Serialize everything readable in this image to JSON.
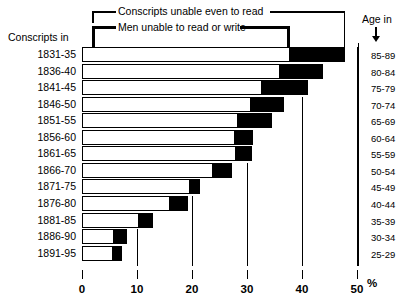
{
  "chart_data": {
    "type": "bar",
    "orientation": "horizontal",
    "stacked": true,
    "title": "",
    "xlabel": "%",
    "ylabel": "Conscripts in",
    "right_axis_label": "Age in",
    "xlim": [
      0,
      50
    ],
    "xticks": [
      0,
      10,
      20,
      30,
      40,
      50
    ],
    "xtick_labels": [
      "0",
      "10",
      "20",
      "30",
      "40",
      "50"
    ],
    "grid": true,
    "legend_position": "top",
    "categories": [
      "1831-35",
      "1836-40",
      "1841-45",
      "1846-50",
      "1851-55",
      "1856-60",
      "1861-65",
      "1866-70",
      "1871-75",
      "1876-80",
      "1881-85",
      "1886-90",
      "1891-95"
    ],
    "right_categories": [
      "85-89",
      "80-84",
      "75-79",
      "70-74",
      "65-69",
      "60-64",
      "55-59",
      "50-54",
      "45-49",
      "40-44",
      "35-39",
      "30-34",
      "25-29"
    ],
    "series": [
      {
        "name": "Men unable to read or write",
        "color": "#ffffff",
        "values": [
          37.8,
          36.0,
          32.7,
          30.7,
          28.4,
          27.8,
          28.0,
          23.8,
          19.6,
          16.0,
          10.4,
          5.8,
          5.6
        ]
      },
      {
        "name": "Conscripts unable even to read",
        "color": "#000000",
        "values": [
          47.8,
          43.8,
          41.1,
          36.7,
          34.5,
          31.1,
          30.9,
          27.3,
          21.5,
          19.3,
          12.9,
          8.2,
          7.3
        ]
      }
    ],
    "annotations": []
  },
  "legend": {
    "top_label": "Conscripts unable even to read",
    "bottom_label": "Men unable to read or write"
  },
  "axes": {
    "left_title": "Conscripts in",
    "right_title": "Age in",
    "unit": "%"
  }
}
